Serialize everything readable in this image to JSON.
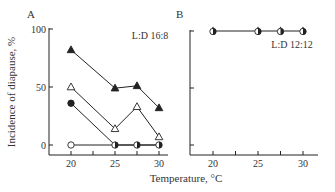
{
  "figure": {
    "xlabel": "Temperature, °C",
    "ylabel": "Incidence of diapause, %"
  },
  "chart_data": [
    {
      "type": "line",
      "panel": "A",
      "annotation": "L:D 16:8",
      "xlabel": "Temperature, °C",
      "ylabel": "Incidence of diapause, %",
      "xticks": [
        20,
        25,
        30
      ],
      "xminor_ticks": [
        22.5,
        27.5
      ],
      "yticks": [
        0,
        50,
        100
      ],
      "xlim": [
        17.5,
        31
      ],
      "ylim": [
        0,
        100
      ],
      "grid": false,
      "x": [
        20,
        25,
        27.5,
        30
      ],
      "series": [
        {
          "name": "filled-triangle",
          "marker": "triangle-filled",
          "values": [
            82,
            49,
            51,
            32
          ]
        },
        {
          "name": "open-triangle",
          "marker": "triangle-open",
          "values": [
            50,
            14,
            33,
            7
          ]
        },
        {
          "name": "filled-circle",
          "marker": "circle-filled",
          "values": [
            36,
            0,
            0,
            0
          ]
        },
        {
          "name": "open-circle",
          "marker": "circle-open",
          "values": [
            0,
            0,
            0,
            0
          ]
        }
      ]
    },
    {
      "type": "line",
      "panel": "B",
      "annotation": "L:D 12:12",
      "xlabel": "Temperature, °C",
      "xticks": [
        20,
        25,
        30
      ],
      "xminor_ticks": [
        22.5,
        27.5
      ],
      "yticks": [
        0,
        50,
        100
      ],
      "xlim": [
        17.5,
        31
      ],
      "ylim": [
        0,
        100
      ],
      "grid": false,
      "x": [
        20,
        25,
        27.5,
        30
      ],
      "series": [
        {
          "name": "all-treatments",
          "marker": "overlapping",
          "values": [
            100,
            100,
            100,
            100
          ]
        }
      ]
    }
  ]
}
